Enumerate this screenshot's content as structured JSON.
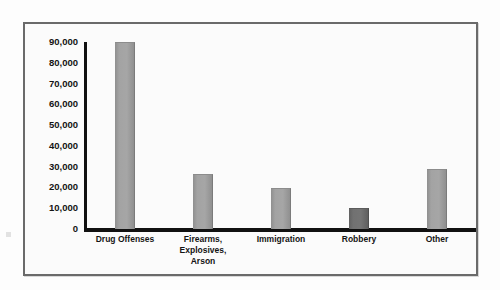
{
  "chart_data": {
    "type": "bar",
    "title": "",
    "subtitle": "",
    "xlabel": "",
    "ylabel": "",
    "categories": [
      "Drug Offenses",
      "Firearms,\nExplosives,\nArson",
      "Immigration",
      "Robbery",
      "Other"
    ],
    "values": [
      90000,
      26500,
      19500,
      10000,
      29000
    ],
    "ylim": [
      0,
      90000
    ],
    "ytick_labels": [
      "90,000",
      "80,000",
      "70,000",
      "60,000",
      "50,000",
      "40,000",
      "30,000",
      "20,000",
      "10,000",
      "0"
    ],
    "ytick_values": [
      90000,
      80000,
      70000,
      60000,
      50000,
      40000,
      30000,
      20000,
      10000,
      0
    ],
    "grid": false,
    "legend": [],
    "legend_position": "none",
    "annotations": [],
    "bar_colors": [
      "#a3a3a3",
      "#a3a3a3",
      "#a3a3a3",
      "#6e6e6e",
      "#a3a3a3"
    ],
    "highlighted_category": "Robbery"
  },
  "style": {
    "frame_border_color": "#6a6a6a",
    "axis_color": "#111111",
    "bar_color": "#a3a3a3",
    "bar_color_dark": "#6e6e6e",
    "plot_background": "#fbfbfb",
    "page_background": "#fdfdfd",
    "label_color": "#141414"
  },
  "artifacts": {
    "bleed_line_1": "                ",
    "bleed_line_2": "            "
  }
}
